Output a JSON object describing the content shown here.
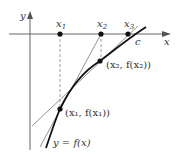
{
  "figure": {
    "axes": {
      "x_label": "x",
      "y_label": "y"
    },
    "points_on_axis": [
      {
        "label": "x1",
        "text_main": "x",
        "sub": "1"
      },
      {
        "label": "x2",
        "text_main": "x",
        "sub": "2"
      },
      {
        "label": "x3",
        "text_main": "x",
        "sub": "3"
      }
    ],
    "root_label": "c",
    "curve_label": "y = f(x)",
    "point_labels": {
      "p1": "(x₁, f(x₁))",
      "p2": "(x₂, f(x₂))"
    },
    "colors": {
      "axis": "#555555",
      "curve": "#111111",
      "tangent": "#777777",
      "dashed": "#888888",
      "dot": "#111111"
    }
  }
}
